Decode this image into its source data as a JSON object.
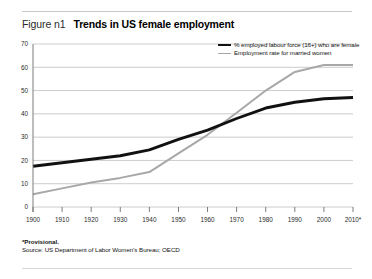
{
  "figure": {
    "label": "Figure n1",
    "title": "Trends in US female employment"
  },
  "footnotes": {
    "provisional": "*Provisional.",
    "source": "Source: US Department of Labor Women's Bureau; OECD"
  },
  "colors": {
    "series_black": "#111111",
    "series_grey": "#a8a8a8",
    "gridline": "#bfbfbf",
    "axis": "#6e6e6e",
    "rule": "#c9c9c9"
  },
  "chart_data": {
    "type": "line",
    "title": "Trends in US female employment",
    "xlabel": "",
    "ylabel": "",
    "x": [
      1900,
      1910,
      1920,
      1930,
      1940,
      1950,
      1960,
      1970,
      1980,
      1990,
      2000,
      2010
    ],
    "xtick_labels": [
      "1900",
      "1910",
      "1920",
      "1930",
      "1940",
      "1950",
      "1960",
      "1970",
      "1980",
      "1990",
      "2000",
      "2010*"
    ],
    "ytick_labels": [
      "0",
      "10",
      "20",
      "30",
      "40",
      "50",
      "60",
      "70"
    ],
    "yticks": [
      0,
      10,
      20,
      30,
      40,
      50,
      60,
      70
    ],
    "ylim": [
      0,
      70
    ],
    "xlim": [
      1900,
      2010
    ],
    "grid": true,
    "legend_position": "top-right",
    "series": [
      {
        "name": "% employed labour force (16+) who are female",
        "color": "#111111",
        "values": [
          17.5,
          19.0,
          20.5,
          22.0,
          24.5,
          29.0,
          33.0,
          38.0,
          42.5,
          45.0,
          46.5,
          47.0
        ]
      },
      {
        "name": "Employment rate for married women",
        "color": "#a8a8a8",
        "values": [
          5.5,
          8.0,
          10.5,
          12.5,
          15.0,
          23.0,
          31.0,
          40.5,
          50.0,
          58.0,
          61.0,
          61.0
        ]
      }
    ]
  }
}
